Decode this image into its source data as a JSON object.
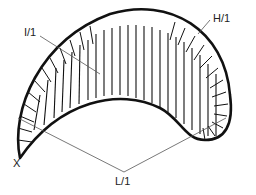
{
  "diagram": {
    "type": "hatched crescent cross-section",
    "labels": {
      "i": "I/1",
      "h": "H/1",
      "x": "X",
      "l": "L/1"
    },
    "colors": {
      "stroke": "#111111",
      "leader": "#555555",
      "background": "#ffffff"
    }
  }
}
